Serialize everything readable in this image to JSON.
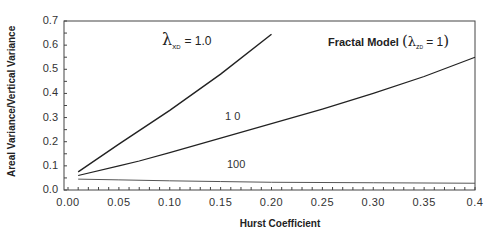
{
  "chart_data": {
    "type": "line",
    "xlabel": "Hurst Coefficient",
    "ylabel": "Areal Variance/Vertical Variance",
    "xlim": [
      0.0,
      0.4
    ],
    "ylim": [
      0.0,
      0.7
    ],
    "grid": false,
    "x_ticks": [
      "0.00",
      "0.05",
      "0.10",
      "0.15",
      "0.20",
      "0.25",
      "0.30",
      "0.35",
      "0.4"
    ],
    "y_ticks": [
      "0.0",
      "0.1",
      "0.2",
      "0.3",
      "0.4",
      "0.5",
      "0.6",
      "0.7"
    ],
    "series": [
      {
        "name": "λ_xD = 1.0",
        "label": "1.0",
        "x": [
          0.01,
          0.05,
          0.1,
          0.15,
          0.2
        ],
        "values": [
          0.075,
          0.19,
          0.33,
          0.48,
          0.645
        ]
      },
      {
        "name": "λ_xD = 10",
        "label": "10",
        "x": [
          0.01,
          0.05,
          0.07,
          0.1,
          0.15,
          0.2,
          0.25,
          0.3,
          0.35,
          0.4
        ],
        "values": [
          0.06,
          0.1,
          0.12,
          0.155,
          0.215,
          0.275,
          0.335,
          0.4,
          0.47,
          0.55
        ]
      },
      {
        "name": "λ_xD = 100",
        "label": "100",
        "x": [
          0.01,
          0.05,
          0.1,
          0.15,
          0.2,
          0.3,
          0.4
        ],
        "values": [
          0.045,
          0.042,
          0.038,
          0.035,
          0.032,
          0.03,
          0.028
        ]
      }
    ],
    "annotations": [
      {
        "text": "λ_xD = 1.0",
        "near": "top curve"
      },
      {
        "text": "10",
        "near": "middle curve"
      },
      {
        "text": "100",
        "near": "bottom curve"
      }
    ]
  },
  "labels": {
    "ylabel": "Areal Variance/Vertical Variance",
    "xlabel": "Hurst Coefficient",
    "title_text": "Fractal Model",
    "title_lambda": "λ",
    "title_sub": "z",
    "title_sub2": "D",
    "title_eq": "= 1",
    "lam_symbol": "λ",
    "lam_sub": "x",
    "lam_sub2": "D",
    "lam_val": "= 1.0",
    "ann_10": "1 0",
    "ann_100": "100"
  }
}
